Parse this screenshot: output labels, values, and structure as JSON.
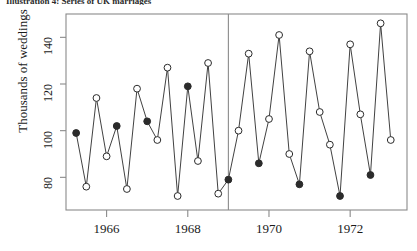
{
  "caption": "Illustration 4:  Series of UK marriages",
  "axes": {
    "ylabel": "Thousands of weddings",
    "xlabel": "",
    "yticks": [
      80,
      100,
      120,
      140
    ],
    "xticks": [
      1966,
      1968,
      1970,
      1972
    ],
    "ylim": [
      66,
      150
    ],
    "xlim": [
      1965.0,
      1973.4
    ],
    "grid": false,
    "frame_color": "#8a8a8a",
    "line_color": "#2b2b2b",
    "divider_x": 1969.0
  },
  "chart_data": {
    "type": "line",
    "title": "Illustration 4:  Series of UK marriages",
    "xlabel": "",
    "ylabel": "Thousands of weddings",
    "ylim": [
      66,
      150
    ],
    "xlim": [
      1965.0,
      1973.4
    ],
    "grid": false,
    "legend": "none",
    "annotations": [
      {
        "type": "vertical-line",
        "x": 1969.0,
        "label": "intervention"
      }
    ],
    "marker_styles": {
      "filled": "solid-circle",
      "open": "open-circle"
    },
    "x": [
      1965.25,
      1965.5,
      1965.75,
      1966.0,
      1966.25,
      1966.5,
      1966.75,
      1967.0,
      1967.25,
      1967.5,
      1967.75,
      1968.0,
      1968.25,
      1968.5,
      1968.75,
      1969.0,
      1969.25,
      1969.5,
      1969.75,
      1970.0,
      1970.25,
      1970.5,
      1970.75,
      1971.0,
      1971.25,
      1971.5,
      1971.75,
      1972.0,
      1972.25,
      1972.5,
      1972.75,
      1973.0
    ],
    "values": [
      99,
      76,
      114,
      89,
      102,
      75,
      118,
      104,
      96,
      127,
      72,
      119,
      87,
      129,
      73,
      79,
      100,
      133,
      86,
      105,
      141,
      90,
      77,
      134,
      108,
      94,
      72,
      137,
      107,
      81,
      146,
      96
    ],
    "markers": [
      "filled",
      "open",
      "open",
      "open",
      "filled",
      "open",
      "open",
      "filled",
      "open",
      "open",
      "open",
      "filled",
      "open",
      "open",
      "open",
      "filled",
      "open",
      "open",
      "filled",
      "open",
      "open",
      "open",
      "filled",
      "open",
      "open",
      "open",
      "filled",
      "open",
      "open",
      "filled",
      "open",
      "open"
    ]
  }
}
